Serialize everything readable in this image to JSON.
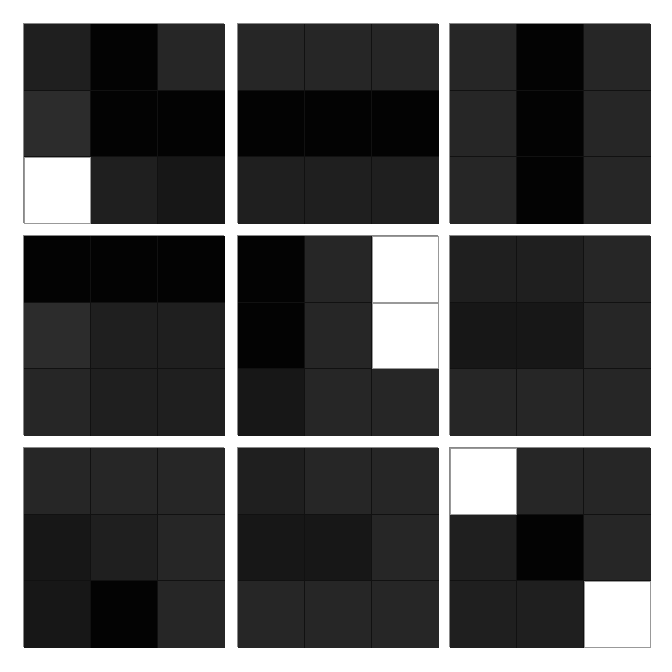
{
  "layout": {
    "rows": 3,
    "cols": 3,
    "panel_size": 200,
    "cells_per_panel": 9
  },
  "colors": {
    "k": "#030303",
    "d1": "#171717",
    "d2": "#1f1f1f",
    "d3": "#262626",
    "d4": "#2c2c2c",
    "w": "#ffffff",
    "background": "#ffffff"
  },
  "panels": [
    {
      "id": 1,
      "x": 23,
      "y": 23,
      "cells": [
        "d2",
        "k",
        "d3",
        "d4",
        "k",
        "k",
        "w",
        "d2",
        "d1"
      ]
    },
    {
      "id": 2,
      "x": 237,
      "y": 23,
      "cells": [
        "d3",
        "d3",
        "d3",
        "k",
        "k",
        "k",
        "d2",
        "d2",
        "d2"
      ]
    },
    {
      "id": 3,
      "x": 449,
      "y": 23,
      "cells": [
        "d3",
        "k",
        "d3",
        "d3",
        "k",
        "d3",
        "d3",
        "k",
        "d3"
      ]
    },
    {
      "id": 4,
      "x": 23,
      "y": 235,
      "cells": [
        "k",
        "k",
        "k",
        "d4",
        "d2",
        "d2",
        "d3",
        "d2",
        "d2"
      ]
    },
    {
      "id": 5,
      "x": 237,
      "y": 235,
      "cells": [
        "k",
        "d3",
        "w",
        "k",
        "d3",
        "w",
        "d1",
        "d3",
        "d3"
      ]
    },
    {
      "id": 6,
      "x": 449,
      "y": 235,
      "cells": [
        "d2",
        "d2",
        "d3",
        "d1",
        "d1",
        "d3",
        "d3",
        "d3",
        "d3"
      ]
    },
    {
      "id": 7,
      "x": 23,
      "y": 447,
      "cells": [
        "d3",
        "d3",
        "d3",
        "d1",
        "d2",
        "d3",
        "d1",
        "k",
        "d3"
      ]
    },
    {
      "id": 8,
      "x": 237,
      "y": 447,
      "cells": [
        "d2",
        "d3",
        "d3",
        "d1",
        "d1",
        "d3",
        "d3",
        "d3",
        "d3"
      ]
    },
    {
      "id": 9,
      "x": 449,
      "y": 447,
      "cells": [
        "w",
        "d3",
        "d3",
        "d2",
        "k",
        "d3",
        "d2",
        "d2",
        "w"
      ]
    }
  ]
}
